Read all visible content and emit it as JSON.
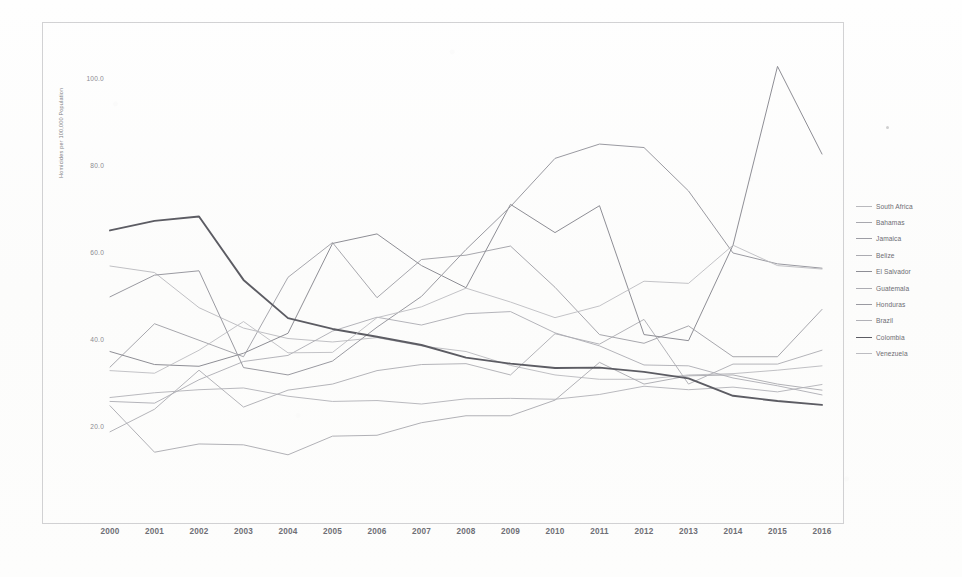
{
  "chart_data": {
    "type": "line",
    "title": "",
    "xlabel": "",
    "ylabel": "Homicides per 100,000 Population",
    "x": [
      2000,
      2001,
      2002,
      2003,
      2004,
      2005,
      2006,
      2007,
      2008,
      2009,
      2010,
      2011,
      2012,
      2013,
      2014,
      2015,
      2016
    ],
    "xlim": [
      2000,
      2016
    ],
    "ylim": [
      10.0,
      110.0
    ],
    "yticks": [
      "100.0",
      "80.0",
      "60.0",
      "40.0",
      "20.0"
    ],
    "ytick_values": [
      100.0,
      80.0,
      60.0,
      40.0,
      20.0
    ],
    "xticks": [
      "2000",
      "2001",
      "2002",
      "2003",
      "2004",
      "2005",
      "2006",
      "2007",
      "2008",
      "2009",
      "2010",
      "2011",
      "2012",
      "2013",
      "2014",
      "2015",
      "2016"
    ],
    "grid": false,
    "legend_position": "right",
    "series": [
      {
        "name": "South Africa",
        "color": "#b9b9bd",
        "width": 0.9,
        "values": [
          57.0,
          55.5,
          47.4,
          42.7,
          40.3,
          39.5,
          40.5,
          38.6,
          37.3,
          34.1,
          31.9,
          30.9,
          30.9,
          31.9,
          32.2,
          33.0,
          34.0
        ]
      },
      {
        "name": "Bahamas",
        "color": "#a8a8ae",
        "width": 0.9,
        "values": [
          24.8,
          14.1,
          16.0,
          15.8,
          13.5,
          17.8,
          18.0,
          20.9,
          22.5,
          22.5,
          26.1,
          34.8,
          29.8,
          31.7,
          31.9,
          29.8,
          28.4
        ]
      },
      {
        "name": "Jamaica",
        "color": "#9d9da4",
        "width": 0.9,
        "values": [
          33.7,
          43.7,
          39.9,
          36.1,
          54.4,
          62.4,
          49.7,
          58.5,
          59.5,
          61.6,
          52.1,
          41.2,
          39.2,
          43.2,
          36.1,
          36.1,
          47.0
        ]
      },
      {
        "name": "Belize",
        "color": "#ababb1",
        "width": 0.9,
        "values": [
          18.8,
          24.0,
          33.0,
          24.5,
          28.4,
          29.8,
          32.9,
          34.3,
          34.5,
          31.9,
          41.4,
          39.0,
          44.7,
          29.8,
          34.4,
          34.4,
          37.6
        ]
      },
      {
        "name": "El Salvador",
        "color": "#8e8e95",
        "width": 1.0,
        "values": [
          37.3,
          34.3,
          33.9,
          36.9,
          41.5,
          62.2,
          64.4,
          57.1,
          52.0,
          71.2,
          64.7,
          70.9,
          41.2,
          39.8,
          61.8,
          103.0,
          82.8
        ]
      },
      {
        "name": "Guatemala",
        "color": "#acacb2",
        "width": 0.9,
        "values": [
          25.8,
          25.4,
          30.8,
          35.0,
          36.4,
          42.0,
          45.2,
          43.4,
          46.0,
          46.5,
          41.6,
          38.6,
          34.2,
          34.0,
          31.2,
          29.4,
          27.3
        ]
      },
      {
        "name": "Honduras",
        "color": "#9a9aa1",
        "width": 1.0,
        "values": [
          49.9,
          54.9,
          55.9,
          33.6,
          31.9,
          35.1,
          42.9,
          50.0,
          60.8,
          70.7,
          81.8,
          85.1,
          84.3,
          74.3,
          60.0,
          57.5,
          56.5
        ]
      },
      {
        "name": "Brazil",
        "color": "#b1b1b7",
        "width": 0.9,
        "values": [
          26.7,
          27.8,
          28.5,
          28.9,
          27.0,
          25.8,
          26.0,
          25.2,
          26.4,
          26.5,
          26.3,
          27.4,
          29.3,
          28.5,
          29.1,
          28.0,
          29.7
        ]
      },
      {
        "name": "Colombia",
        "color": "#5c5c63",
        "width": 1.9,
        "values": [
          65.2,
          67.4,
          68.4,
          53.8,
          45.0,
          42.5,
          40.7,
          38.8,
          35.9,
          34.5,
          33.5,
          33.6,
          32.6,
          31.1,
          27.1,
          25.9,
          25.0
        ]
      },
      {
        "name": "Venezuela",
        "color": "#bcbcc1",
        "width": 0.9,
        "values": [
          32.9,
          32.3,
          37.6,
          44.2,
          37.0,
          37.1,
          45.1,
          47.6,
          51.9,
          48.7,
          45.1,
          47.8,
          53.5,
          53.0,
          61.8,
          57.1,
          56.3
        ]
      }
    ]
  }
}
